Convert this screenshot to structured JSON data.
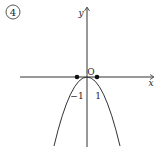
{
  "figure": {
    "number_label": "4",
    "axes": {
      "x_label": "x",
      "y_label": "y",
      "origin_label": "O"
    },
    "ticks": [
      {
        "value": -1,
        "label": "−1"
      },
      {
        "value": 1,
        "label": "1"
      }
    ],
    "curve": {
      "type": "parabola",
      "opens": "down",
      "vertex": [
        0,
        0
      ],
      "description": "downward parabola with vertex at origin"
    },
    "points": [
      {
        "x": -1,
        "y": 0
      },
      {
        "x": 1,
        "y": 0
      }
    ],
    "colors": {
      "stroke": "#333333",
      "background": "#ffffff"
    }
  }
}
